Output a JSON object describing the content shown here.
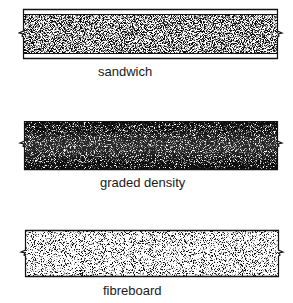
{
  "diagram": {
    "type": "cross-section illustrations of board types",
    "panels": [
      {
        "id": "sandwich",
        "label": "sandwich",
        "structure": "dense particle core with thin light face layers top and bottom"
      },
      {
        "id": "graded-density",
        "label": "graded density",
        "structure": "dense dark outer surfaces grading to lighter low-density core"
      },
      {
        "id": "fibreboard",
        "label": "fibreboard",
        "structure": "uniform particle texture throughout"
      }
    ]
  },
  "colors": {
    "ink": "#111111",
    "background": "#ffffff"
  }
}
